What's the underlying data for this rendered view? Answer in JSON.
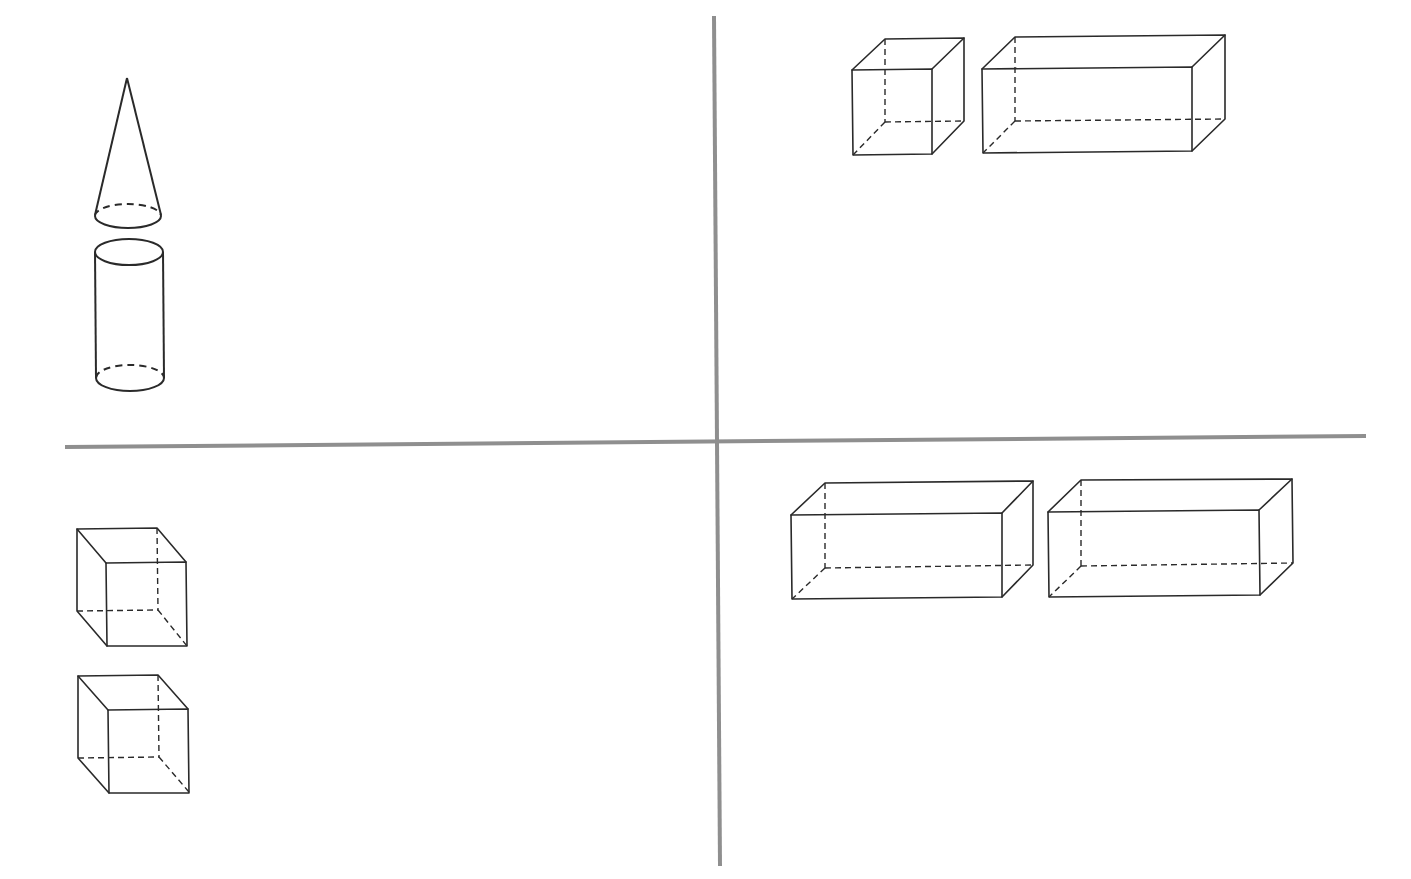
{
  "figure": {
    "colors": {
      "background": "#ffffff",
      "divider": "#8f8f8f",
      "stroke": "#2a2a2a"
    },
    "dividers": {
      "vertical": {
        "x1": 714,
        "y1": 16,
        "x2": 720,
        "y2": 866
      },
      "horizontal": {
        "x1": 65,
        "y1": 447,
        "x2": 1366,
        "y2": 436
      }
    },
    "quadrants": [
      {
        "id": "top-left",
        "shapes": [
          {
            "type": "cone",
            "label": "cone"
          },
          {
            "type": "cylinder",
            "label": "cylinder"
          }
        ]
      },
      {
        "id": "top-right",
        "shapes": [
          {
            "type": "cube",
            "label": "cube"
          },
          {
            "type": "cuboid",
            "label": "rectangular prism"
          }
        ]
      },
      {
        "id": "bottom-left",
        "shapes": [
          {
            "type": "cube",
            "label": "cube"
          },
          {
            "type": "cube",
            "label": "cube"
          }
        ]
      },
      {
        "id": "bottom-right",
        "shapes": [
          {
            "type": "cuboid",
            "label": "rectangular prism"
          },
          {
            "type": "cuboid",
            "label": "rectangular prism"
          }
        ]
      }
    ]
  }
}
